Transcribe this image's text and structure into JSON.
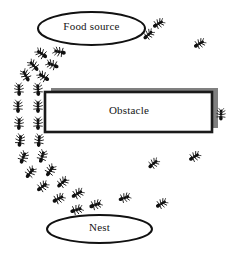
{
  "diagram": {
    "canvas": {
      "width": 240,
      "height": 258,
      "background": "#ffffff"
    },
    "colors": {
      "ink": "#111111",
      "ant_body": "#101010",
      "shadow_gray": "#808080",
      "obstacle_fill": "#ffffff",
      "obstacle_border": "#1a1a1a",
      "label_text": "#151515"
    },
    "nodes": {
      "food_source": {
        "label": "Food source",
        "shape": "ellipse",
        "cx": 91.5,
        "cy": 28.5,
        "rx": 53.5,
        "ry": 16.5,
        "stroke": "#111111",
        "stroke_width": 2,
        "fill": "#ffffff"
      },
      "obstacle": {
        "label": "Obstacle",
        "shape": "rectangle",
        "x": 45,
        "y": 92,
        "width": 167,
        "height": 40,
        "stroke": "#1a1a1a",
        "stroke_width": 2.6,
        "fill": "#ffffff",
        "shadow": {
          "offset_x": 6,
          "offset_y": -4,
          "color": "#808080"
        }
      },
      "nest": {
        "label": "Nest",
        "shape": "ellipse",
        "cx": 99.5,
        "cy": 229,
        "rx": 52.5,
        "ry": 14,
        "stroke": "#111111",
        "stroke_width": 2,
        "fill": "#ffffff"
      }
    },
    "ants": [
      {
        "id": "ant-01",
        "x": 42,
        "y": 54,
        "rot": 35,
        "scale": 1.0
      },
      {
        "id": "ant-02",
        "x": 60,
        "y": 52,
        "rot": 12,
        "scale": 1.0
      },
      {
        "id": "ant-03",
        "x": 34,
        "y": 66,
        "rot": 48,
        "scale": 1.0
      },
      {
        "id": "ant-04",
        "x": 53,
        "y": 65,
        "rot": 22,
        "scale": 1.0
      },
      {
        "id": "ant-05",
        "x": 26,
        "y": 76,
        "rot": 62,
        "scale": 1.0
      },
      {
        "id": "ant-06",
        "x": 44,
        "y": 77,
        "rot": 34,
        "scale": 1.0
      },
      {
        "id": "ant-07",
        "x": 19,
        "y": 90,
        "rot": 88,
        "scale": 1.0
      },
      {
        "id": "ant-08",
        "x": 38,
        "y": 90,
        "rot": 86,
        "scale": 1.0
      },
      {
        "id": "ant-09",
        "x": 18,
        "y": 107,
        "rot": 90,
        "scale": 1.0
      },
      {
        "id": "ant-10",
        "x": 38,
        "y": 107,
        "rot": 90,
        "scale": 1.0
      },
      {
        "id": "ant-11",
        "x": 19,
        "y": 124,
        "rot": 92,
        "scale": 1.0
      },
      {
        "id": "ant-12",
        "x": 38,
        "y": 124,
        "rot": 90,
        "scale": 1.0
      },
      {
        "id": "ant-13",
        "x": 20,
        "y": 141,
        "rot": 98,
        "scale": 1.0
      },
      {
        "id": "ant-14",
        "x": 39,
        "y": 141,
        "rot": 95,
        "scale": 1.0
      },
      {
        "id": "ant-15",
        "x": 23,
        "y": 158,
        "rot": 112,
        "scale": 1.0
      },
      {
        "id": "ant-16",
        "x": 42,
        "y": 157,
        "rot": 108,
        "scale": 1.0
      },
      {
        "id": "ant-17",
        "x": 30,
        "y": 173,
        "rot": 128,
        "scale": 1.0
      },
      {
        "id": "ant-18",
        "x": 50,
        "y": 171,
        "rot": 124,
        "scale": 1.0
      },
      {
        "id": "ant-19",
        "x": 42,
        "y": 187,
        "rot": 143,
        "scale": 1.0
      },
      {
        "id": "ant-20",
        "x": 62,
        "y": 183,
        "rot": 138,
        "scale": 1.0
      },
      {
        "id": "ant-21",
        "x": 58,
        "y": 199,
        "rot": 152,
        "scale": 1.0
      },
      {
        "id": "ant-22",
        "x": 77,
        "y": 194,
        "rot": 150,
        "scale": 1.0
      },
      {
        "id": "ant-23",
        "x": 76,
        "y": 210,
        "rot": 162,
        "scale": 1.0
      },
      {
        "id": "ant-24",
        "x": 95,
        "y": 205,
        "rot": 160,
        "scale": 1.0
      },
      {
        "id": "ant-25",
        "x": 148,
        "y": 35,
        "rot": 138,
        "scale": 0.95
      },
      {
        "id": "ant-26",
        "x": 158,
        "y": 24,
        "rot": 150,
        "scale": 0.95
      },
      {
        "id": "ant-27",
        "x": 199,
        "y": 44,
        "rot": 150,
        "scale": 0.95
      },
      {
        "id": "ant-28",
        "x": 221,
        "y": 115,
        "rot": 92,
        "scale": 0.95
      },
      {
        "id": "ant-29",
        "x": 153,
        "y": 164,
        "rot": 140,
        "scale": 0.95
      },
      {
        "id": "ant-30",
        "x": 194,
        "y": 157,
        "rot": 148,
        "scale": 0.95
      },
      {
        "id": "ant-31",
        "x": 161,
        "y": 204,
        "rot": 150,
        "scale": 0.95
      },
      {
        "id": "ant-32",
        "x": 124,
        "y": 198,
        "rot": 160,
        "scale": 0.95
      }
    ]
  }
}
